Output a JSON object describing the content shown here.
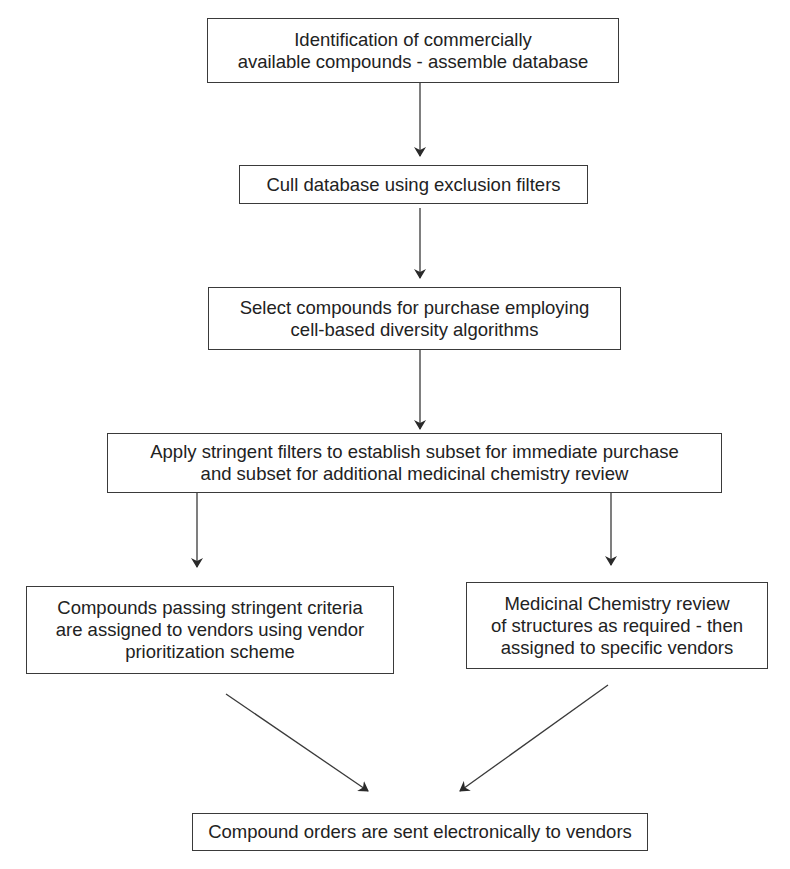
{
  "diagram": {
    "type": "flowchart",
    "nodes": [
      {
        "id": "identify",
        "lines": [
          "Identification of commercially",
          "available compounds - assemble database"
        ]
      },
      {
        "id": "cull",
        "lines": [
          "Cull database using exclusion filters"
        ]
      },
      {
        "id": "select",
        "lines": [
          "Select compounds for purchase employing",
          "cell-based diversity algorithms"
        ]
      },
      {
        "id": "apply-filters",
        "lines": [
          "Apply stringent filters to establish subset for immediate purchase",
          "and subset for additional medicinal chemistry review"
        ]
      },
      {
        "id": "passing-criteria",
        "lines": [
          "Compounds passing stringent criteria",
          "are assigned to vendors using vendor",
          "prioritization scheme"
        ]
      },
      {
        "id": "medchem-review",
        "lines": [
          "Medicinal Chemistry review",
          "of structures as required - then",
          "assigned to specific vendors"
        ]
      },
      {
        "id": "orders-sent",
        "lines": [
          "Compound orders are sent electronically to vendors"
        ]
      }
    ],
    "edges": [
      {
        "from": "identify",
        "to": "cull"
      },
      {
        "from": "cull",
        "to": "select"
      },
      {
        "from": "select",
        "to": "apply-filters"
      },
      {
        "from": "apply-filters",
        "to": "passing-criteria"
      },
      {
        "from": "apply-filters",
        "to": "medchem-review"
      },
      {
        "from": "passing-criteria",
        "to": "orders-sent"
      },
      {
        "from": "medchem-review",
        "to": "orders-sent"
      }
    ],
    "colors": {
      "line": "#3a3a3a",
      "text": "#222222",
      "background": "#ffffff"
    }
  }
}
